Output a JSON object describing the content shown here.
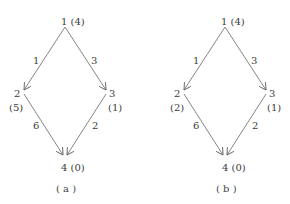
{
  "diagrams": [
    {
      "caption": "( a )",
      "nodes": [
        {
          "id": "1",
          "label": "1",
          "value": "(4)"
        },
        {
          "id": "2",
          "label": "2",
          "value": "(5)"
        },
        {
          "id": "3",
          "label": "3",
          "value": "(1)"
        },
        {
          "id": "4",
          "label": "4",
          "value": "(0)"
        }
      ],
      "edges": [
        {
          "from": "1",
          "to": "2",
          "weight": "1"
        },
        {
          "from": "1",
          "to": "3",
          "weight": "3"
        },
        {
          "from": "2",
          "to": "4",
          "weight": "6"
        },
        {
          "from": "3",
          "to": "4",
          "weight": "2"
        }
      ]
    },
    {
      "caption": "( b )",
      "nodes": [
        {
          "id": "1",
          "label": "1",
          "value": "(4)"
        },
        {
          "id": "2",
          "label": "2",
          "value": "(2)"
        },
        {
          "id": "3",
          "label": "3",
          "value": "(1)"
        },
        {
          "id": "4",
          "label": "4",
          "value": "(0)"
        }
      ],
      "edges": [
        {
          "from": "1",
          "to": "2",
          "weight": "1"
        },
        {
          "from": "1",
          "to": "3",
          "weight": "3"
        },
        {
          "from": "2",
          "to": "4",
          "weight": "6"
        },
        {
          "from": "3",
          "to": "4",
          "weight": "2"
        }
      ]
    }
  ],
  "colors": {
    "line": "#555555",
    "text": "#3a3a3a",
    "background": "#ffffff"
  }
}
